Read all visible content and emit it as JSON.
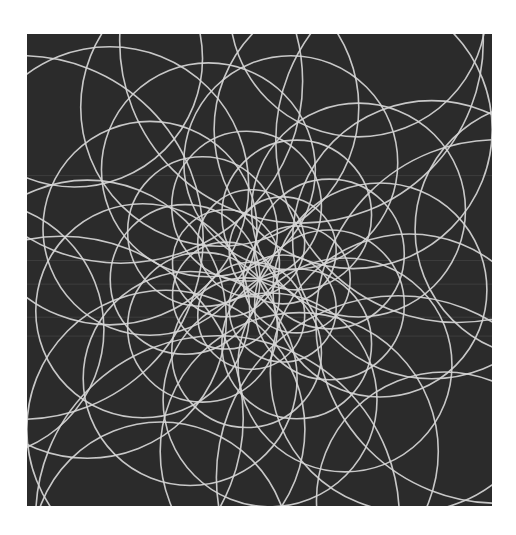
{
  "artwork": {
    "subject": "overlapping circles in rotational spirograph pattern",
    "colors": {
      "frame": "#ffffff",
      "background": "#2b2b2b",
      "line": "#d6d6d6",
      "scanline": "#4a4a4a"
    },
    "rings": [
      {
        "orbit_fraction": 0.52,
        "radius_fraction": 0.34,
        "count": 8,
        "phase_deg": 10
      },
      {
        "orbit_fraction": 0.38,
        "radius_fraction": 0.26,
        "count": 8,
        "phase_deg": 32
      },
      {
        "orbit_fraction": 0.26,
        "radius_fraction": 0.2,
        "count": 9,
        "phase_deg": 5
      },
      {
        "orbit_fraction": 0.16,
        "radius_fraction": 0.14,
        "count": 9,
        "phase_deg": 20
      },
      {
        "orbit_fraction": 0.08,
        "radius_fraction": 0.1,
        "count": 7,
        "phase_deg": 0
      },
      {
        "orbit_fraction": 0.62,
        "radius_fraction": 0.24,
        "count": 6,
        "phase_deg": 50
      }
    ],
    "scanlines_fraction": [
      0.3,
      0.48,
      0.53,
      0.6,
      0.64
    ]
  }
}
